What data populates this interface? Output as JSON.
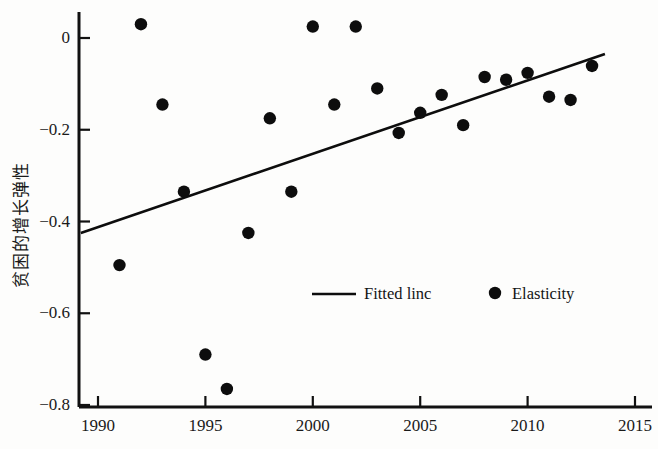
{
  "chart_data": {
    "type": "scatter",
    "title": "",
    "xlabel": "",
    "ylabel": "贫困的增长弹性",
    "xlim": [
      1988.2,
      2016.2
    ],
    "ylim": [
      -0.84,
      0.063
    ],
    "xticks": [
      1990,
      1995,
      2000,
      2005,
      2010,
      2015
    ],
    "xtick_labels": [
      "1990",
      "1995",
      "2000",
      "2005",
      "2010",
      "2015"
    ],
    "yticks": [
      0,
      -0.2,
      -0.4,
      -0.6,
      -0.8
    ],
    "ytick_labels": [
      "0",
      "−0.2",
      "−0.4",
      "−0.6",
      "−0.8"
    ],
    "grid": false,
    "legend_position": "lower-center-right",
    "marker_color": "#0d0d0d",
    "line_color": "#0d0d0d",
    "axis_color": "#111111",
    "series": [
      {
        "name": "Elasticity",
        "type": "scatter",
        "x": [
          1991,
          1992,
          1993,
          1994,
          1995,
          1996,
          1997,
          1998,
          1999,
          2000,
          2001,
          2002,
          2003,
          2004,
          2005,
          2006,
          2007,
          2008,
          2009,
          2010,
          2011,
          2012,
          2013
        ],
        "values": [
          -0.495,
          0.03,
          -0.145,
          -0.335,
          -0.69,
          -0.765,
          -0.425,
          -0.175,
          -0.335,
          0.025,
          -0.145,
          0.025,
          -0.11,
          -0.207,
          -0.163,
          -0.124,
          -0.19,
          -0.085,
          -0.091,
          -0.076,
          -0.128,
          -0.135,
          -0.061
        ]
      },
      {
        "name": "Fitted linc",
        "type": "line",
        "x": [
          1989.2,
          2013.6
        ],
        "values": [
          -0.425,
          -0.035
        ]
      }
    ]
  },
  "legend": {
    "items": [
      {
        "label": "Fitted linc",
        "marker": "line",
        "color": "#0d0d0d"
      },
      {
        "label": "Elasticity",
        "marker": "dot",
        "color": "#0d0d0d"
      }
    ]
  }
}
